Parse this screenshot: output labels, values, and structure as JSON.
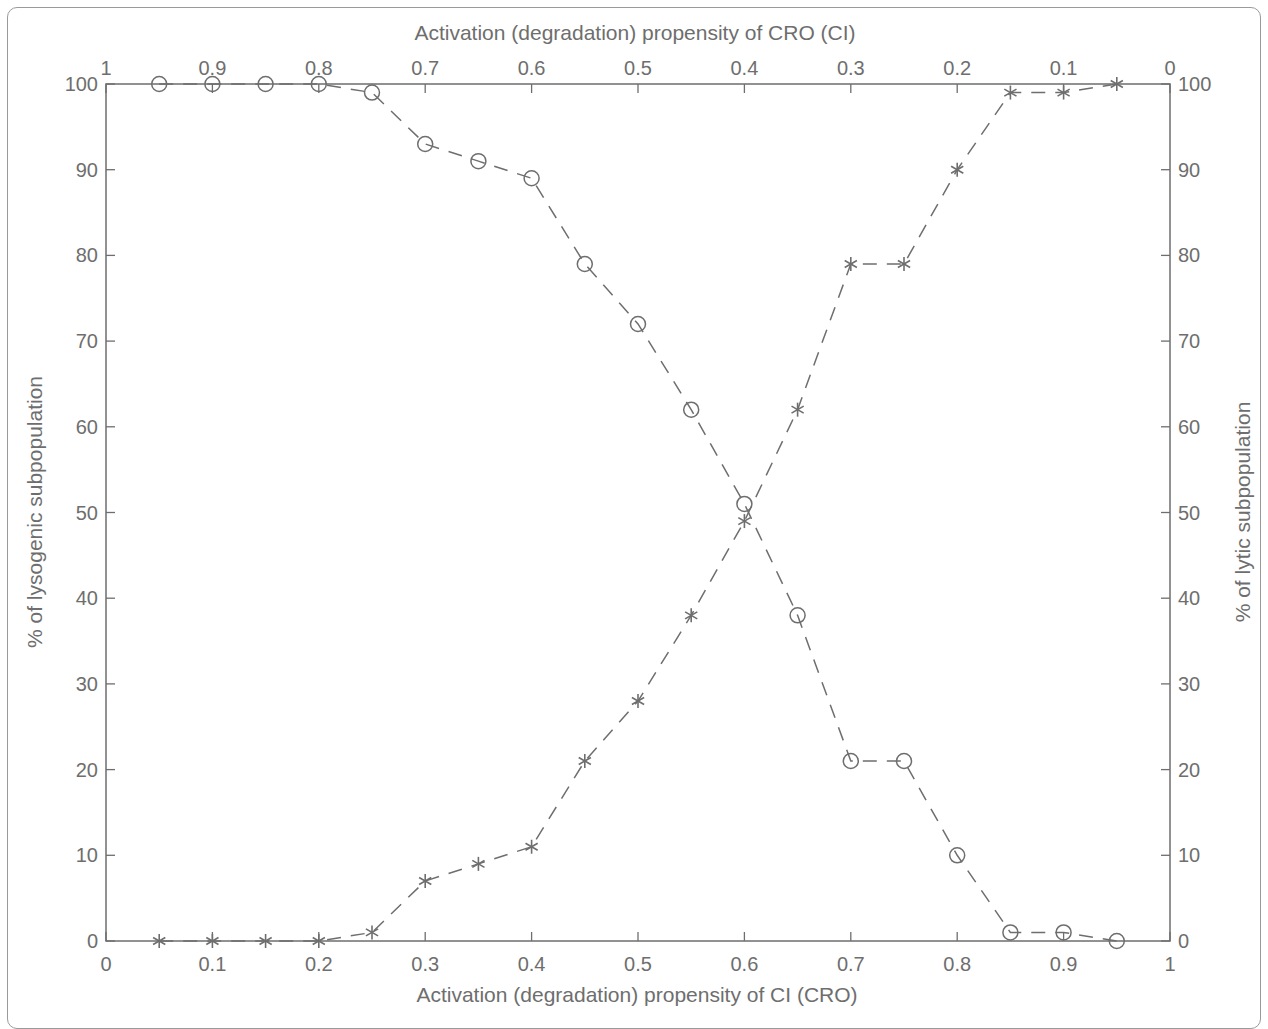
{
  "chart_data": {
    "type": "line",
    "title": "",
    "xlabel": "Activation (degradation) propensity of CI (CRO)",
    "x2label": "Activation (degradation) propensity of CRO (CI)",
    "ylabel": "% of lysogenic subpopulation",
    "y2label": "% of lytic subpopulation",
    "xlim": [
      0,
      1
    ],
    "ylim": [
      0,
      100
    ],
    "x_ticks": [
      "0",
      "0.1",
      "0.2",
      "0.3",
      "0.4",
      "0.5",
      "0.6",
      "0.7",
      "0.8",
      "0.9",
      "1"
    ],
    "x2_ticks": [
      "1",
      "0.9",
      "0.8",
      "0.7",
      "0.6",
      "0.5",
      "0.4",
      "0.3",
      "0.2",
      "0.1",
      "0"
    ],
    "y_ticks": [
      "0",
      "10",
      "20",
      "30",
      "40",
      "50",
      "60",
      "70",
      "80",
      "90",
      "100"
    ],
    "y2_ticks": [
      "0",
      "10",
      "20",
      "30",
      "40",
      "50",
      "60",
      "70",
      "80",
      "90",
      "100"
    ],
    "grid": false,
    "legend": null,
    "x": [
      0.05,
      0.1,
      0.15,
      0.2,
      0.25,
      0.3,
      0.35,
      0.4,
      0.45,
      0.5,
      0.55,
      0.6,
      0.65,
      0.7,
      0.75,
      0.8,
      0.85,
      0.9,
      0.95
    ],
    "series": [
      {
        "name": "% of lysogenic subpopulation",
        "marker": "circle",
        "line_style": "dashed",
        "axis": "left",
        "values": [
          100,
          100,
          100,
          100,
          99,
          93,
          91,
          89,
          79,
          72,
          62,
          51,
          38,
          21,
          21,
          10,
          1,
          1,
          0
        ]
      },
      {
        "name": "% of lytic subpopulation",
        "marker": "asterisk",
        "line_style": "dashed",
        "axis": "right",
        "values": [
          0,
          0,
          0,
          0,
          1,
          7,
          9,
          11,
          21,
          28,
          38,
          49,
          62,
          79,
          79,
          90,
          99,
          99,
          100
        ]
      }
    ],
    "colors": {
      "axis": "#6e6e6e",
      "line": "#6e6e6e",
      "background": "#ffffff"
    }
  }
}
